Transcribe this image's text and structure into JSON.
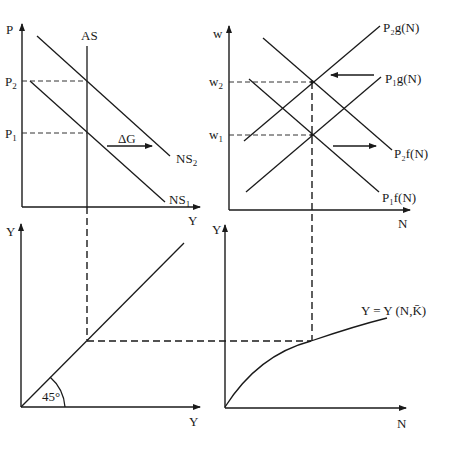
{
  "diagram": {
    "panels": {
      "top_left": {
        "y_axis_label": "P",
        "x_axis_label": "Y",
        "curves": {
          "as": "AS",
          "ns1": "NS",
          "ns1_sub": "1",
          "ns2": "NS",
          "ns2_sub": "2"
        },
        "levels": {
          "p1": "P",
          "p1_sub": "1",
          "p2": "P",
          "p2_sub": "2"
        },
        "shift_label": "ΔG"
      },
      "top_right": {
        "y_axis_label": "w",
        "x_axis_label": "N",
        "levels": {
          "w1": "w",
          "w1_sub": "1",
          "w2": "w",
          "w2_sub": "2"
        },
        "curves": {
          "p2g": "P₂g(N)",
          "p1g": "P₁g(N)",
          "p2f": "P₂f(N)",
          "p1f": "P₁f(N)"
        }
      },
      "bottom_left": {
        "y_axis_label": "Y",
        "x_axis_label": "Y",
        "angle_label": "45°"
      },
      "bottom_right": {
        "y_axis_label": "Y",
        "x_axis_label": "N",
        "curve_label": "Y = Y (N,K̄)"
      }
    }
  }
}
